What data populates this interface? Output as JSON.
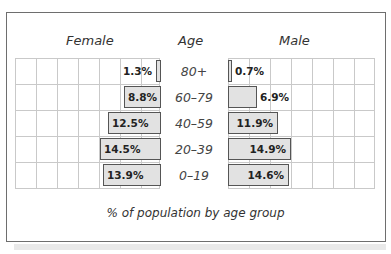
{
  "chart_data": {
    "type": "bar",
    "orientation": "horizontal-population-pyramid",
    "title": "",
    "caption": "% of population by age group",
    "left_header": "Female",
    "center_header": "Age",
    "right_header": "Male",
    "categories": [
      "80+",
      "60–79",
      "40–59",
      "20–39",
      "0–19"
    ],
    "series": [
      {
        "name": "Female",
        "values": [
          1.3,
          8.8,
          12.5,
          14.5,
          13.9
        ],
        "labels": [
          "1.3%",
          "8.8%",
          "12.5%",
          "14.5%",
          "13.9%"
        ]
      },
      {
        "name": "Male",
        "values": [
          0.7,
          6.9,
          11.9,
          14.9,
          14.6
        ],
        "labels": [
          "0.7%",
          "6.9%",
          "11.9%",
          "14.9%",
          "14.6%"
        ]
      }
    ],
    "xlabel": "% of population by age group",
    "ylabel": "Age",
    "xlim": [
      0,
      35
    ],
    "grid": true,
    "grid_step_percent": 5,
    "colors": {
      "bar_fill": "#e2e2e2",
      "bar_border": "#555555",
      "grid": "#c9c9c9",
      "frame": "#6e6e6e"
    }
  }
}
